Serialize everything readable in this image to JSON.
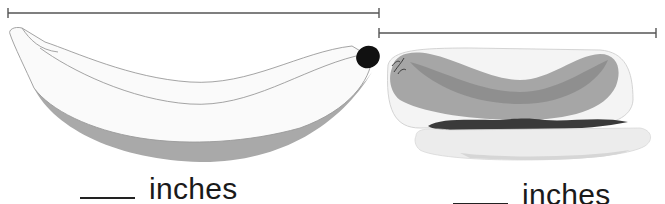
{
  "items": [
    {
      "name": "banana",
      "answer": {
        "value": "",
        "unit": "inches"
      },
      "measure_line": {
        "x1": 8,
        "x2": 379,
        "y": 13
      }
    },
    {
      "name": "hot dog",
      "answer": {
        "value": "",
        "unit": "inches"
      },
      "measure_line": {
        "x1": 379,
        "x2": 656,
        "y": 33
      }
    }
  ],
  "colors": {
    "line": "#555555",
    "banana_fill": "#fafafa",
    "banana_shadow": "#a9a9a9",
    "banana_tip": "#111111",
    "sausage_outer": "#a6a6a6",
    "sausage_inner": "#8a8a8a",
    "mustard": "#3a3a3a",
    "bun": "#ececec",
    "bun_shadow": "#d6d6d6"
  }
}
